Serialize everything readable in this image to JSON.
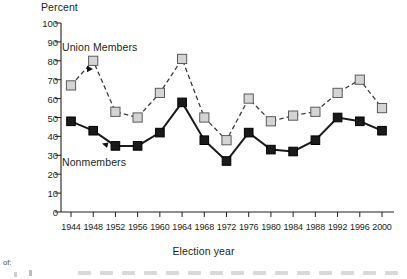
{
  "chart_data": {
    "type": "line",
    "title": "",
    "ylabel": "Percent",
    "xlabel": "Election year",
    "ylim": [
      0,
      100
    ],
    "ytick_values": [
      0,
      10,
      20,
      30,
      40,
      50,
      60,
      70,
      80,
      90,
      100
    ],
    "ytick_labels": [
      "0",
      "10",
      "20",
      "30",
      "40",
      "50",
      "60",
      "70",
      "80",
      "90",
      "100"
    ],
    "categories": [
      "1944",
      "1948",
      "1952",
      "1956",
      "1960",
      "1964",
      "1968",
      "1972",
      "1976",
      "1980",
      "1984",
      "1988",
      "1992",
      "1996",
      "2000"
    ],
    "grid": false,
    "legend_position": "inline-annotations",
    "series": [
      {
        "name": "Union Members",
        "style": "dashed",
        "marker": "square-open-gray",
        "color": "#d4d4d4",
        "line_color": "#3c3c3c",
        "values": [
          67,
          80,
          53,
          50,
          63,
          81,
          50,
          38,
          60,
          48,
          51,
          53,
          63,
          70,
          55
        ]
      },
      {
        "name": "Nonmembers",
        "style": "solid",
        "marker": "square-filled-black",
        "color": "#1a1a1a",
        "line_color": "#1a1a1a",
        "values": [
          48,
          43,
          35,
          35,
          42,
          58,
          38,
          27,
          42,
          33,
          32,
          38,
          50,
          48,
          43
        ]
      }
    ],
    "annotations": [
      {
        "label": "Union Members",
        "type": "series-callout",
        "points_to": "1948"
      },
      {
        "label": "Nonmembers",
        "type": "series-callout",
        "points_to": "1952"
      }
    ]
  },
  "axes": {
    "y_title": "Percent",
    "x_title": "Election year"
  },
  "labels": {
    "union": "Union Members",
    "nonmembers": "Nonmembers"
  },
  "footer": {
    "fragment": "of:"
  }
}
